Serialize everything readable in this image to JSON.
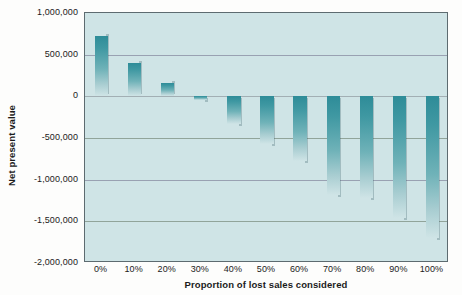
{
  "chart_data": {
    "type": "bar",
    "title": "",
    "xlabel": "Proportion of lost sales considered",
    "ylabel": "Net present value",
    "categories": [
      "0%",
      "10%",
      "20%",
      "30%",
      "40%",
      "50%",
      "60%",
      "70%",
      "80%",
      "90%",
      "100%"
    ],
    "values": [
      730000,
      400000,
      160000,
      -45000,
      -335000,
      -575000,
      -780000,
      -1180000,
      -1215000,
      -1465000,
      -1705000
    ],
    "ylim": [
      -2000000,
      1000000
    ],
    "ytick_labels": [
      "1,000,000",
      "500,000",
      "0",
      "-500,000",
      "-1,000,000",
      "-1,500,000",
      "-2,000,000"
    ],
    "ytick_values": [
      1000000,
      500000,
      0,
      -500000,
      -1000000,
      -1500000,
      -2000000
    ],
    "grid": true,
    "legend": "none",
    "series": [
      {
        "name": "Net present value",
        "values": [
          730000,
          400000,
          160000,
          -45000,
          -335000,
          -575000,
          -780000,
          -1180000,
          -1215000,
          -1465000,
          -1705000
        ]
      }
    ],
    "colors": {
      "plot_background": "#cfe4e6",
      "bar_dark": "#2e8c98",
      "bar_light": "#cfe4e6",
      "gridline": "#7e8f93",
      "axis_border": "#5d6b70",
      "text": "#1b1b1b",
      "page_background": "#fdfdfc"
    }
  }
}
